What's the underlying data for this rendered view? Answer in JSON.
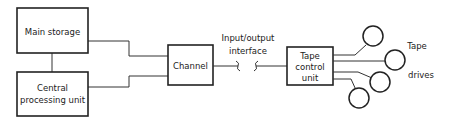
{
  "diagram": {
    "blocks": {
      "main_storage": {
        "label": "Main storage"
      },
      "cpu": {
        "label_line1": "Central",
        "label_line2": "processing unit"
      },
      "channel": {
        "label": "Channel"
      },
      "tape_control": {
        "label_line1": "Tape",
        "label_line2": "control",
        "label_line3": "unit"
      }
    },
    "interface": {
      "label_line1": "Input/output",
      "label_line2": "interface"
    },
    "tape_drives": {
      "label_line1": "Tape",
      "label_line2": "drives",
      "count": 4
    },
    "colors": {
      "stroke": "#222222",
      "background": "#ffffff"
    }
  }
}
